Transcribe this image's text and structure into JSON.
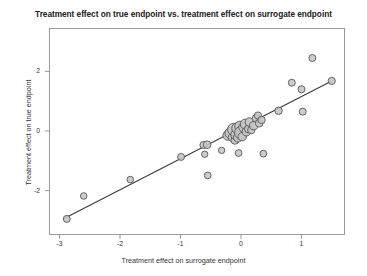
{
  "chart_data": {
    "type": "scatter",
    "title": "Treatment effect on true endpoint vs. treatment effect on surrogate endpoint",
    "xlabel": "Treatment effect on surrogate endpoint",
    "ylabel": "Treatment effect on true endpoint",
    "xlim": [
      -3.17,
      1.72
    ],
    "ylim": [
      -3.45,
      2.92
    ],
    "xticks": [
      -3,
      -2,
      -1,
      0,
      1
    ],
    "xtick_labels": [
      "-3",
      "-2",
      "-1",
      "0",
      "1"
    ],
    "yticks": [
      2,
      0,
      -2
    ],
    "ytick_labels": [
      "2",
      "0",
      "-2"
    ],
    "grid": false,
    "legend": false,
    "marker": {
      "shape": "circle",
      "fill": "#c6c6c6",
      "edge": "#555555",
      "sized_by_weight": true
    },
    "regression_line": {
      "color": "#3a3a3a",
      "x_start": -2.94,
      "y_start": -2.95,
      "x_end": 1.5,
      "y_end": 1.68
    },
    "points": [
      {
        "x": -2.88,
        "y": -2.95,
        "size": 7.0
      },
      {
        "x": -2.6,
        "y": -2.18,
        "size": 6.6
      },
      {
        "x": -1.83,
        "y": -1.63,
        "size": 6.6
      },
      {
        "x": -0.99,
        "y": -0.87,
        "size": 7.0
      },
      {
        "x": -0.62,
        "y": -0.47,
        "size": 7.2
      },
      {
        "x": -0.6,
        "y": -0.78,
        "size": 6.4
      },
      {
        "x": -0.56,
        "y": -0.46,
        "size": 7.6
      },
      {
        "x": -0.55,
        "y": -1.49,
        "size": 6.8
      },
      {
        "x": -0.32,
        "y": -0.65,
        "size": 6.4
      },
      {
        "x": -0.22,
        "y": -0.15,
        "size": 9.6
      },
      {
        "x": -0.17,
        "y": -0.07,
        "size": 11.6
      },
      {
        "x": -0.14,
        "y": -0.22,
        "size": 8.6
      },
      {
        "x": -0.12,
        "y": 0.05,
        "size": 12.4
      },
      {
        "x": -0.1,
        "y": -0.31,
        "size": 8.0
      },
      {
        "x": -0.08,
        "y": -0.13,
        "size": 10.6
      },
      {
        "x": -0.06,
        "y": 0.09,
        "size": 11.2
      },
      {
        "x": -0.05,
        "y": -0.22,
        "size": 9.0
      },
      {
        "x": -0.04,
        "y": -0.74,
        "size": 6.8
      },
      {
        "x": -0.02,
        "y": 0.16,
        "size": 10.2
      },
      {
        "x": 0.0,
        "y": -0.06,
        "size": 12.8
      },
      {
        "x": 0.02,
        "y": -0.19,
        "size": 8.4
      },
      {
        "x": 0.04,
        "y": 0.12,
        "size": 9.4
      },
      {
        "x": 0.07,
        "y": 0.23,
        "size": 10.0
      },
      {
        "x": 0.09,
        "y": -0.02,
        "size": 8.8
      },
      {
        "x": 0.12,
        "y": 0.07,
        "size": 7.8
      },
      {
        "x": 0.14,
        "y": 0.3,
        "size": 8.6
      },
      {
        "x": 0.17,
        "y": 0.03,
        "size": 7.4
      },
      {
        "x": 0.21,
        "y": 0.18,
        "size": 8.2
      },
      {
        "x": 0.25,
        "y": 0.42,
        "size": 7.8
      },
      {
        "x": 0.28,
        "y": 0.52,
        "size": 7.2
      },
      {
        "x": 0.3,
        "y": 0.26,
        "size": 7.6
      },
      {
        "x": 0.34,
        "y": 0.37,
        "size": 7.4
      },
      {
        "x": 0.37,
        "y": -0.76,
        "size": 6.8
      },
      {
        "x": 0.62,
        "y": 0.68,
        "size": 7.4
      },
      {
        "x": 0.84,
        "y": 1.62,
        "size": 7.0
      },
      {
        "x": 1.0,
        "y": 1.4,
        "size": 7.0
      },
      {
        "x": 1.02,
        "y": 0.65,
        "size": 7.0
      },
      {
        "x": 1.18,
        "y": 2.45,
        "size": 7.0
      },
      {
        "x": 1.5,
        "y": 1.68,
        "size": 7.2
      }
    ]
  }
}
